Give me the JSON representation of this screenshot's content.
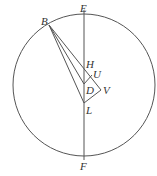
{
  "diagram": {
    "circle": {
      "cx": 84,
      "cy": 85,
      "r": 71
    },
    "stroke_color": "#555555",
    "points": {
      "B": {
        "x": 49,
        "y": 25
      },
      "E": {
        "x": 84,
        "y": 14
      },
      "H": {
        "x": 84,
        "y": 64
      },
      "U": {
        "x": 92,
        "y": 75
      },
      "D": {
        "x": 84,
        "y": 84
      },
      "V": {
        "x": 101,
        "y": 90
      },
      "L": {
        "x": 84,
        "y": 103
      },
      "F": {
        "x": 84,
        "y": 156
      }
    },
    "labels": {
      "B": "B",
      "E": "E",
      "H": "H",
      "U": "U",
      "D": "D",
      "V": "V",
      "L": "L",
      "F": "F"
    }
  }
}
